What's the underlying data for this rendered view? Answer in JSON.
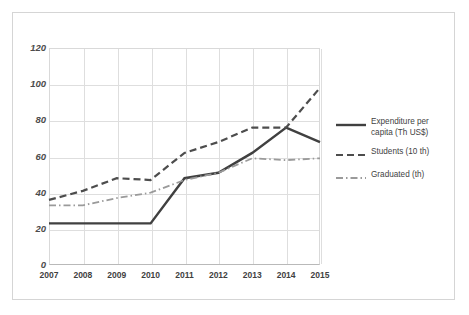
{
  "chart_data": {
    "type": "line",
    "title": "",
    "xlabel": "",
    "ylabel": "",
    "categories": [
      "2007",
      "2008",
      "2009",
      "2010",
      "2011",
      "2012",
      "2013",
      "2014",
      "2015"
    ],
    "ylim": [
      0,
      120
    ],
    "yticks": [
      "0",
      "20",
      "40",
      "60",
      "80",
      "100",
      "120"
    ],
    "ytick_values": [
      0,
      20,
      40,
      60,
      80,
      100,
      120
    ],
    "grid": true,
    "legend_position": "right",
    "series": [
      {
        "name": "Expenditure per capita (Th US$)",
        "style": "solid",
        "color": "#404040",
        "values": [
          23,
          23,
          23,
          23,
          48,
          51,
          62,
          76,
          68
        ]
      },
      {
        "name": "Students (10 th)",
        "style": "dashed",
        "color": "#4d4d4d",
        "values": [
          36,
          41,
          48,
          47,
          62,
          68,
          76,
          76,
          98
        ]
      },
      {
        "name": "Graduated (th)",
        "style": "dashdot",
        "color": "#9a9a9a",
        "values": [
          33,
          33,
          37,
          40,
          47,
          51,
          59,
          58,
          59
        ]
      }
    ]
  },
  "legend": {
    "items": [
      {
        "label_line1": "Expenditure per",
        "label_line2": "capita (Th US$)",
        "swatch": "solid-line-swatch"
      },
      {
        "label_line1": "Students (10 th)",
        "label_line2": "",
        "swatch": "dashed-line-swatch"
      },
      {
        "label_line1": "Graduated (th)",
        "label_line2": "",
        "swatch": "dashdot-line-swatch"
      }
    ]
  },
  "colors": {
    "series_solid": "#404040",
    "series_dashed": "#4d4d4d",
    "series_dashdot": "#9a9a9a",
    "gridline": "#dedede",
    "frame": "#d5d5d5",
    "axis_text": "#4c4c4c",
    "background": "#ffffff"
  }
}
